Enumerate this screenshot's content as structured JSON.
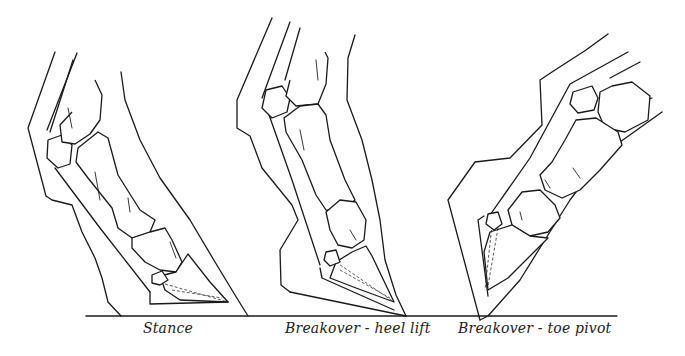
{
  "figure": {
    "panels": [
      {
        "id": "stance",
        "caption": "Stance"
      },
      {
        "id": "heel-lift",
        "caption": "Breakover  - heel lift"
      },
      {
        "id": "toe-pivot",
        "caption": "Breakover - toe pivot"
      }
    ],
    "ground_line": {
      "x1": 86,
      "x2": 617,
      "y": 316
    },
    "colors": {
      "line": "#1a1a1a",
      "background": "#ffffff"
    }
  }
}
